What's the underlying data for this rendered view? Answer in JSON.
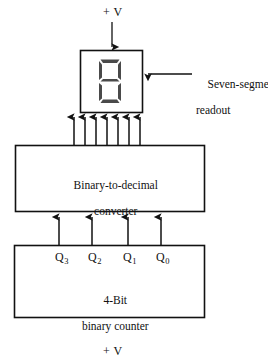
{
  "diagram": {
    "type": "block-diagram",
    "colors": {
      "background": "#ffffff",
      "line": "#111111",
      "segment": "#4a4a4a",
      "text": "#111111"
    },
    "supply_top": {
      "label": "+ V",
      "arrow_direction": "down"
    },
    "supply_bottom": {
      "label": "+ V"
    },
    "readout": {
      "callout_label_line1": "Seven-segment",
      "callout_label_line2": "readout",
      "display_digit": "8",
      "segments_lit": [
        "a",
        "b",
        "c",
        "d",
        "e",
        "f",
        "g"
      ],
      "segment_count": 7
    },
    "converter": {
      "label_line1": "Binary-to-decimal",
      "label_line2": "converter",
      "output_line_count": 7,
      "input_line_count": 4
    },
    "counter": {
      "label_line1": "4-Bit",
      "label_line2": "binary counter",
      "outputs": [
        {
          "name": "Q",
          "subscript": "3"
        },
        {
          "name": "Q",
          "subscript": "2"
        },
        {
          "name": "Q",
          "subscript": "1"
        },
        {
          "name": "Q",
          "subscript": "0"
        }
      ]
    }
  }
}
